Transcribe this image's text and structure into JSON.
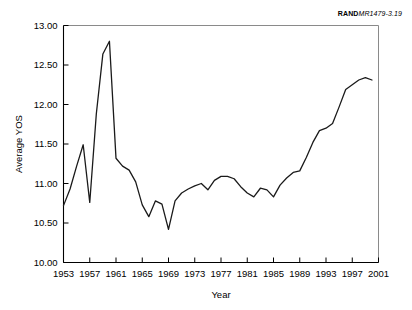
{
  "source_label": {
    "bold_part": "RAND",
    "italic_part": "MR1479-3.19"
  },
  "chart_data": {
    "type": "line",
    "title": "",
    "xlabel": "Year",
    "ylabel": "Average YOS",
    "xlim": [
      1953,
      2001
    ],
    "ylim": [
      10.0,
      13.0
    ],
    "xticks": [
      1953,
      1957,
      1961,
      1965,
      1969,
      1973,
      1977,
      1981,
      1985,
      1989,
      1993,
      1997,
      2001
    ],
    "xtick_labels": [
      "1953",
      "1957",
      "1961",
      "1965",
      "1969",
      "1973",
      "1977",
      "1981",
      "1985",
      "1989",
      "1993",
      "1997",
      "2001"
    ],
    "yticks": [
      10.0,
      10.5,
      11.0,
      11.5,
      12.0,
      12.5,
      13.0
    ],
    "ytick_labels": [
      "10.00",
      "10.50",
      "11.00",
      "11.50",
      "12.00",
      "12.50",
      "13.00"
    ],
    "grid": false,
    "legend": false,
    "series": [
      {
        "name": "Average YOS",
        "x": [
          1953,
          1954,
          1955,
          1956,
          1957,
          1958,
          1959,
          1960,
          1961,
          1962,
          1963,
          1964,
          1965,
          1966,
          1967,
          1968,
          1969,
          1970,
          1971,
          1972,
          1973,
          1974,
          1975,
          1976,
          1977,
          1978,
          1979,
          1980,
          1981,
          1982,
          1983,
          1984,
          1985,
          1986,
          1987,
          1988,
          1989,
          1990,
          1991,
          1992,
          1993,
          1994,
          1995,
          1996,
          1997,
          1998,
          1999,
          2000
        ],
        "values": [
          10.72,
          10.93,
          11.22,
          11.49,
          10.76,
          11.88,
          12.64,
          12.8,
          11.32,
          11.22,
          11.17,
          11.02,
          10.73,
          10.58,
          10.78,
          10.74,
          10.42,
          10.78,
          10.88,
          10.93,
          10.97,
          11.0,
          10.92,
          11.04,
          11.09,
          11.09,
          11.06,
          10.96,
          10.88,
          10.83,
          10.94,
          10.92,
          10.83,
          10.98,
          11.07,
          11.14,
          11.16,
          11.33,
          11.52,
          11.67,
          11.7,
          11.76,
          11.97,
          12.19,
          12.25,
          12.31,
          12.34,
          12.31
        ]
      }
    ]
  }
}
